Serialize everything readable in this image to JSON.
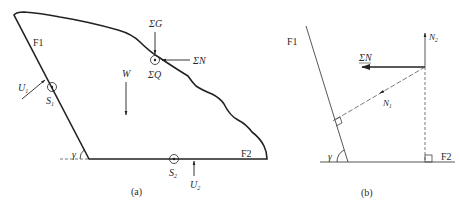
{
  "figure": {
    "panel_a": {
      "caption": "(a)",
      "plane_labels": {
        "f1": "F1",
        "f2": "F2"
      },
      "angle_label": "γ",
      "forces": {
        "sum_g": "ΣG",
        "sum_n": "ΣN",
        "sum_q": "ΣQ",
        "weight": "W",
        "u1": "U",
        "u1_sub": "1",
        "u2": "U",
        "u2_sub": "2"
      },
      "points": {
        "s1": "S",
        "s1_sub": "1",
        "s2": "S",
        "s2_sub": "2"
      }
    },
    "panel_b": {
      "caption": "(b)",
      "plane_labels": {
        "f1": "F1",
        "f2": "F2"
      },
      "angle_label": "γ",
      "forces": {
        "sum_n": "ΣN",
        "n1": "N",
        "n1_sub": "1",
        "n2": "N",
        "n2_sub": "2"
      }
    }
  }
}
